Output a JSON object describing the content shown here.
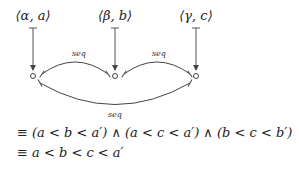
{
  "diagram": {
    "nodes": [
      {
        "label": "⟨α, a⟩",
        "x": 33
      },
      {
        "label": "⟨β, b⟩",
        "x": 115
      },
      {
        "label": "⟨γ, c⟩",
        "x": 196
      }
    ],
    "edges": [
      {
        "from": 1,
        "to": 0,
        "label": "seq"
      },
      {
        "from": 2,
        "to": 1,
        "label": "seq"
      },
      {
        "from": 2,
        "to": 0,
        "label": "seq"
      }
    ]
  },
  "equations": {
    "line1": "≡ (a < b < a′)  ∧  (a < c < a′)  ∧  (b < c < b′)",
    "line2": "≡ a < b < c < a′"
  }
}
